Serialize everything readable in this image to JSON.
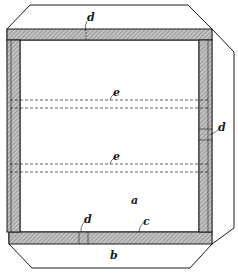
{
  "figure": {
    "labels": {
      "a": "a",
      "b": "b",
      "c": "c",
      "d_top": "d",
      "d_right": "d",
      "d_bottom": "d",
      "e_upper": "e",
      "e_lower": "e"
    },
    "colors": {
      "line": "#1a1a1a",
      "hatch_fill": "#b8b8b8",
      "background": "#ffffff"
    },
    "parts": [
      {
        "id": "a",
        "description": "inner panel"
      },
      {
        "id": "b",
        "description": "outer folded flap"
      },
      {
        "id": "c",
        "description": "frame strip"
      },
      {
        "id": "d",
        "description": "joint marks"
      },
      {
        "id": "e",
        "description": "dashed fold lines"
      }
    ]
  }
}
